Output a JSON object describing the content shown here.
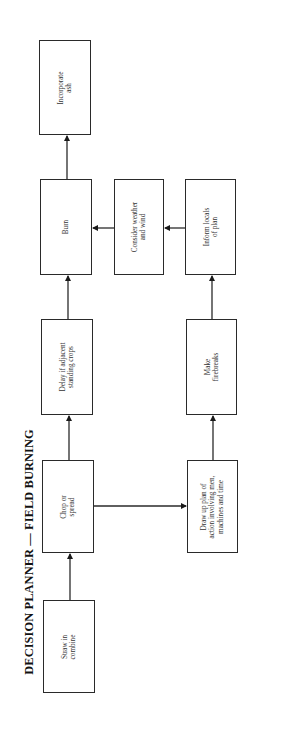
{
  "diagram": {
    "title": "DECISION PLANNER — FIELD BURNING",
    "orientation": "rotated-90-ccw",
    "line_color": "#2a2a2a",
    "nodes": [
      {
        "id": "straw",
        "label": "Straw in\ncombine",
        "x": 43,
        "y": 600,
        "w": 52,
        "h": 93
      },
      {
        "id": "chop",
        "label": "Chop or\nspread",
        "x": 42,
        "y": 460,
        "w": 52,
        "h": 93
      },
      {
        "id": "delay",
        "label": "Delay if adjacent\nstanding crops",
        "x": 41,
        "y": 319,
        "w": 52,
        "h": 96
      },
      {
        "id": "burn",
        "label": "Burn",
        "x": 40,
        "y": 179,
        "w": 52,
        "h": 96
      },
      {
        "id": "incorporate",
        "label": "Incorporate\nash",
        "x": 39,
        "y": 40,
        "w": 52,
        "h": 95
      },
      {
        "id": "drawup",
        "label": "Draw up plan of\naction involving men,\nmachines and time",
        "x": 187,
        "y": 460,
        "w": 51,
        "h": 93
      },
      {
        "id": "firebreaks",
        "label": "Make\nfirebreaks",
        "x": 186,
        "y": 319,
        "w": 51,
        "h": 96
      },
      {
        "id": "inform",
        "label": "Inform locals\nof plan",
        "x": 185,
        "y": 179,
        "w": 51,
        "h": 96
      },
      {
        "id": "weather",
        "label": "Consider weather\nand wind",
        "x": 114,
        "y": 179,
        "w": 50,
        "h": 96
      }
    ],
    "edges": [
      {
        "from": "straw",
        "to": "chop",
        "x1": 70,
        "y1": 600,
        "x2": 70,
        "y2": 554
      },
      {
        "from": "chop",
        "to": "delay",
        "x1": 69,
        "y1": 460,
        "x2": 69,
        "y2": 416
      },
      {
        "from": "delay",
        "to": "burn",
        "x1": 68,
        "y1": 319,
        "x2": 68,
        "y2": 276
      },
      {
        "from": "burn",
        "to": "incorporate",
        "x1": 67,
        "y1": 179,
        "x2": 67,
        "y2": 136
      },
      {
        "from": "chop",
        "to": "drawup",
        "x1": 94,
        "y1": 506,
        "x2": 186,
        "y2": 506
      },
      {
        "from": "drawup",
        "to": "firebreaks",
        "x1": 213,
        "y1": 460,
        "x2": 213,
        "y2": 416
      },
      {
        "from": "firebreaks",
        "to": "inform",
        "x1": 212,
        "y1": 319,
        "x2": 212,
        "y2": 276
      },
      {
        "from": "inform",
        "to": "weather",
        "x1": 185,
        "y1": 228,
        "x2": 165,
        "y2": 228
      },
      {
        "from": "weather",
        "to": "burn",
        "x1": 114,
        "y1": 228,
        "x2": 93,
        "y2": 228
      }
    ]
  }
}
